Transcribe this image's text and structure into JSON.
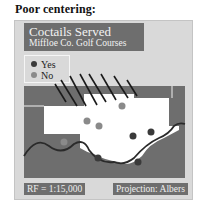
{
  "heading": "Poor centering:",
  "map": {
    "title": "Coctails Served",
    "subtitle": "Miffloe Co. Golf Courses",
    "legend": [
      {
        "label": "Yes",
        "color": "#3a3a3a"
      },
      {
        "label": "No",
        "color": "#8a8a8a"
      }
    ],
    "scale": "RF = 1:15,000",
    "projection": "Projection: Albers"
  },
  "colors": {
    "frame_bg": "#d9d9d9",
    "box_bg": "#6e6e6e",
    "land": "#ffffff",
    "water": "#6e6e6e",
    "outline": "#2a2a2a"
  }
}
